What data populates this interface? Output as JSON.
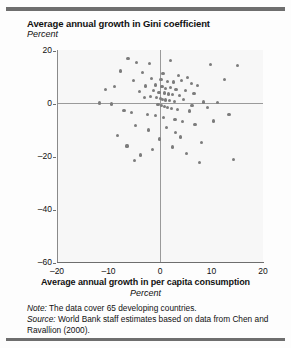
{
  "figure": {
    "title": "Average annual growth in Gini coefficient",
    "subtitle": "Percent",
    "xaxis_title": "Average annual growth in per capita consumption",
    "xaxis_subtitle": "Percent",
    "note_label": "Note:",
    "note_text": " The data cover 65 developing countries.",
    "source_label": "Source:",
    "source_text": " World Bank staff estimates based on data from Chen and Ravallion (2000).",
    "accent_rule_color": "#6e6e6e",
    "marker_color": "#7c7c7c",
    "plot_bg_color": "#f7f7f7"
  },
  "chart_data": {
    "type": "scatter",
    "title": "Average annual growth in Gini coefficient",
    "xlabel": "Average annual growth in per capita consumption",
    "ylabel": "Average annual growth in Gini coefficient",
    "xunit": "Percent",
    "yunit": "Percent",
    "xlim": [
      -20,
      20
    ],
    "ylim": [
      -60,
      20
    ],
    "xticks": [
      -20,
      -10,
      0,
      10,
      20
    ],
    "xticklabels": [
      "–20",
      "–10",
      "0",
      "10",
      "20"
    ],
    "yticks": [
      20,
      0,
      -20,
      -40,
      -60
    ],
    "yticklabels": [
      "20",
      "0",
      "–20",
      "–40",
      "–60"
    ],
    "grid": false,
    "legend": null,
    "zero_lines": {
      "horizontal": 0,
      "vertical": 0
    },
    "n_points": 65,
    "annotations": [],
    "points": [
      [
        -6.2,
        16.8
      ],
      [
        -4.6,
        15.2
      ],
      [
        -2.0,
        15.0
      ],
      [
        2.1,
        16.0
      ],
      [
        9.8,
        14.6
      ],
      [
        -7.6,
        12.1
      ],
      [
        -3.4,
        11.6
      ],
      [
        0.6,
        11.2
      ],
      [
        3.6,
        10.4
      ],
      [
        5.4,
        9.6
      ],
      [
        -5.2,
        8.4
      ],
      [
        -1.6,
        9.1
      ],
      [
        0.2,
        8.8
      ],
      [
        1.4,
        8.2
      ],
      [
        2.6,
        7.9
      ],
      [
        4.2,
        8.6
      ],
      [
        6.1,
        7.4
      ],
      [
        7.3,
        6.6
      ],
      [
        -8.8,
        6.2
      ],
      [
        -2.8,
        6.4
      ],
      [
        -0.9,
        6.8
      ],
      [
        0.4,
        6.1
      ],
      [
        1.1,
        5.6
      ],
      [
        2.0,
        5.9
      ],
      [
        3.1,
        5.2
      ],
      [
        5.0,
        4.8
      ],
      [
        -4.0,
        4.2
      ],
      [
        -1.2,
        4.6
      ],
      [
        -0.2,
        4.1
      ],
      [
        0.8,
        3.8
      ],
      [
        1.6,
        3.4
      ],
      [
        2.4,
        3.1
      ],
      [
        3.8,
        2.8
      ],
      [
        6.6,
        3.6
      ],
      [
        -3.0,
        2.2
      ],
      [
        -1.8,
        2.6
      ],
      [
        -0.6,
        2.0
      ],
      [
        0.1,
        1.8
      ],
      [
        0.5,
        1.4
      ],
      [
        1.0,
        1.1
      ],
      [
        1.8,
        0.9
      ],
      [
        2.8,
        0.6
      ],
      [
        4.6,
        1.2
      ],
      [
        8.4,
        0.4
      ],
      [
        11.2,
        0.2
      ],
      [
        -11.8,
        0.0
      ],
      [
        -9.4,
        -0.4
      ],
      [
        -0.4,
        -0.6
      ],
      [
        0.3,
        -1.0
      ],
      [
        0.9,
        -1.4
      ],
      [
        1.5,
        -1.8
      ],
      [
        2.2,
        -2.2
      ],
      [
        3.4,
        -2.6
      ],
      [
        5.8,
        -3.0
      ],
      [
        9.2,
        -1.6
      ],
      [
        -7.0,
        -2.8
      ],
      [
        -5.6,
        -3.6
      ],
      [
        -2.4,
        -4.2
      ],
      [
        -0.8,
        -4.8
      ],
      [
        0.7,
        -5.4
      ],
      [
        2.9,
        -6.2
      ],
      [
        4.4,
        -7.0
      ],
      [
        -4.8,
        -8.6
      ],
      [
        -2.2,
        -10.2
      ],
      [
        1.2,
        -9.4
      ],
      [
        3.0,
        -11.0
      ],
      [
        6.8,
        -8.2
      ],
      [
        -8.2,
        -12.4
      ],
      [
        -0.1,
        -13.6
      ],
      [
        4.0,
        -12.8
      ],
      [
        -6.4,
        -16.2
      ],
      [
        -1.4,
        -17.4
      ],
      [
        2.5,
        -16.6
      ],
      [
        8.0,
        -14.8
      ],
      [
        -3.8,
        -19.6
      ],
      [
        5.2,
        -19.0
      ],
      [
        -5.0,
        -21.8
      ],
      [
        7.6,
        -22.6
      ],
      [
        14.2,
        -21.2
      ],
      [
        15.0,
        14.0
      ],
      [
        12.6,
        8.8
      ],
      [
        13.4,
        -4.4
      ],
      [
        -10.6,
        5.0
      ],
      [
        10.4,
        -6.8
      ],
      [
        6.2,
        -0.8
      ]
    ]
  }
}
